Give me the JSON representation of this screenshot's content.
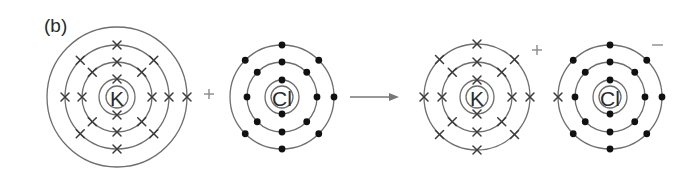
{
  "figure": {
    "panel_label": "(b)",
    "colors": {
      "shell": "#6e6e6e",
      "electron": "#111111",
      "text": "#2a2a2a"
    },
    "reactants": [
      {
        "id": "K-atom",
        "symbol": "K",
        "electron_marker": "cross",
        "center": [
          117,
          97
        ],
        "nucleus_radius": 11,
        "shells": [
          {
            "radius": 18,
            "electrons": 2
          },
          {
            "radius": 35,
            "electrons": 8
          },
          {
            "radius": 52,
            "electrons": 8
          },
          {
            "radius": 70,
            "electrons": 1
          }
        ]
      },
      {
        "id": "Cl-atom",
        "symbol": "Cl",
        "electron_marker": "dot",
        "center": [
          282,
          97
        ],
        "nucleus_radius": 11,
        "shells": [
          {
            "radius": 17,
            "electrons": 2
          },
          {
            "radius": 35,
            "electrons": 8
          },
          {
            "radius": 52,
            "electrons": 7
          }
        ]
      }
    ],
    "plus_sign": "+",
    "arrow": "→",
    "products": [
      {
        "id": "K-ion",
        "symbol": "K",
        "charge": "+",
        "electron_marker": "cross",
        "center": [
          477,
          97
        ],
        "nucleus_radius": 11,
        "shells": [
          {
            "radius": 17,
            "electrons": 2
          },
          {
            "radius": 35,
            "electrons": 8
          },
          {
            "radius": 53,
            "electrons": 8
          }
        ]
      },
      {
        "id": "Cl-ion",
        "symbol": "Cl",
        "charge": "−",
        "electron_marker": "dot",
        "transferred_electron_marker": "cross",
        "center": [
          610,
          97
        ],
        "nucleus_radius": 11,
        "shells": [
          {
            "radius": 17,
            "electrons": 2
          },
          {
            "radius": 35,
            "electrons": 8
          },
          {
            "radius": 52,
            "electrons": 8
          }
        ]
      }
    ]
  }
}
